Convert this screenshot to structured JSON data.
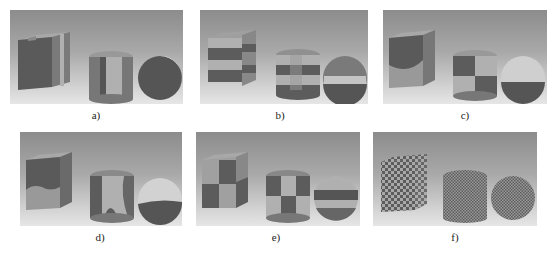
{
  "figure": {
    "panels": [
      {
        "id": "a",
        "label": "a)",
        "description": "cube, cylinder and sphere split into vertical slab partitions"
      },
      {
        "id": "b",
        "label": "b)",
        "description": "objects partitioned into horizontal bands with offset blocks"
      },
      {
        "id": "c",
        "label": "c)",
        "description": "objects split with curved boundaries into large regions"
      },
      {
        "id": "d",
        "label": "d)",
        "description": "objects split with rounded blob-like regions"
      },
      {
        "id": "e",
        "label": "e)",
        "description": "objects partitioned into a coarse checkerboard"
      },
      {
        "id": "f",
        "label": "f)",
        "description": "objects covered with a fine checkerboard texture"
      }
    ]
  },
  "colors": {
    "dark": "#585858",
    "mid": "#8a8a8a",
    "light": "#b4b4b4",
    "highlight": "#e8e8e8"
  }
}
